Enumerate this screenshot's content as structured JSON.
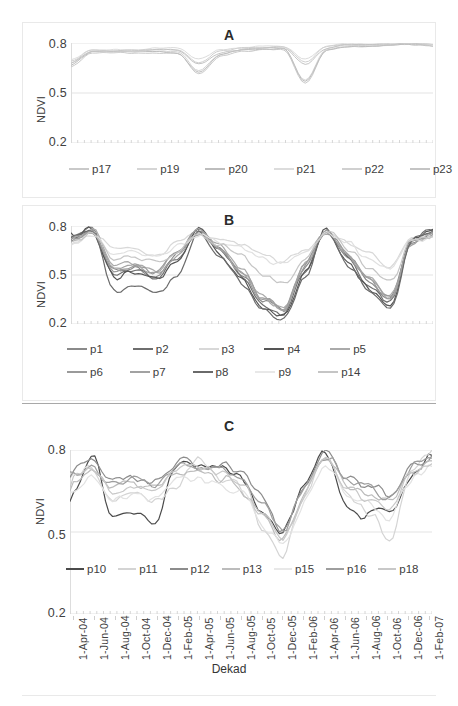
{
  "figure": {
    "axis_title_y": "NDVI",
    "axis_title_x": "Dekad",
    "y_ticks": [
      "0.2",
      "0.5",
      "0.8"
    ],
    "x_ticks": [
      "1-Apr-04",
      "1-Jun-04",
      "1-Aug-04",
      "1-Oct-04",
      "1-Dec-04",
      "1-Feb-05",
      "1-Apr-05",
      "1-Jun-05",
      "1-Aug-05",
      "1-Oct-05",
      "1-Dec-05",
      "1-Feb-06",
      "1-Apr-06",
      "1-Jun-06",
      "1-Aug-06",
      "1-Oct-06",
      "1-Dec-06",
      "1-Feb-07"
    ],
    "panels": {
      "a_title": "A",
      "b_title": "B",
      "c_title": "C"
    }
  },
  "chart_data": [
    {
      "type": "line",
      "title": "A",
      "xlabel": "",
      "ylabel": "NDVI",
      "ylim": [
        0.2,
        0.8
      ],
      "grid": true,
      "legend_position": "below",
      "x": [
        "1-Apr-04",
        "1-Jun-04",
        "1-Aug-04",
        "1-Oct-04",
        "1-Dec-04",
        "1-Feb-05",
        "1-Apr-05",
        "1-Jun-05",
        "1-Aug-05",
        "1-Oct-05",
        "1-Dec-05",
        "1-Feb-06",
        "1-Apr-06",
        "1-Jun-06",
        "1-Aug-06",
        "1-Oct-06",
        "1-Dec-06",
        "1-Feb-07"
      ],
      "series": [
        {
          "name": "p17",
          "color": "#c9c9c9",
          "values": [
            0.66,
            0.74,
            0.74,
            0.74,
            0.74,
            0.74,
            0.61,
            0.72,
            0.75,
            0.76,
            0.76,
            0.55,
            0.76,
            0.78,
            0.78,
            0.79,
            0.79,
            0.79
          ]
        },
        {
          "name": "p19",
          "color": "#d5d5d5",
          "values": [
            0.68,
            0.75,
            0.74,
            0.75,
            0.75,
            0.75,
            0.63,
            0.73,
            0.76,
            0.77,
            0.77,
            0.57,
            0.77,
            0.79,
            0.78,
            0.79,
            0.8,
            0.78
          ]
        },
        {
          "name": "p20",
          "color": "#bdbdbd",
          "values": [
            0.67,
            0.75,
            0.75,
            0.75,
            0.75,
            0.74,
            0.62,
            0.73,
            0.76,
            0.76,
            0.77,
            0.56,
            0.76,
            0.78,
            0.78,
            0.79,
            0.79,
            0.79
          ]
        },
        {
          "name": "p21",
          "color": "#dcdcdc",
          "values": [
            0.7,
            0.76,
            0.76,
            0.76,
            0.77,
            0.77,
            0.7,
            0.76,
            0.77,
            0.78,
            0.78,
            0.7,
            0.78,
            0.8,
            0.79,
            0.8,
            0.8,
            0.79
          ]
        },
        {
          "name": "p22",
          "color": "#d0d0d0",
          "values": [
            0.69,
            0.76,
            0.75,
            0.75,
            0.76,
            0.76,
            0.68,
            0.75,
            0.77,
            0.77,
            0.78,
            0.68,
            0.78,
            0.79,
            0.79,
            0.8,
            0.8,
            0.79
          ]
        },
        {
          "name": "p23",
          "color": "#c4c4c4",
          "values": [
            0.68,
            0.75,
            0.75,
            0.76,
            0.76,
            0.76,
            0.67,
            0.74,
            0.76,
            0.77,
            0.77,
            0.67,
            0.77,
            0.79,
            0.79,
            0.79,
            0.8,
            0.78
          ]
        }
      ]
    },
    {
      "type": "line",
      "title": "B",
      "xlabel": "",
      "ylabel": "NDVI",
      "ylim": [
        0.2,
        0.8
      ],
      "grid": true,
      "legend_position": "below",
      "x": [
        "1-Apr-04",
        "1-Jun-04",
        "1-Aug-04",
        "1-Oct-04",
        "1-Dec-04",
        "1-Feb-05",
        "1-Apr-05",
        "1-Jun-05",
        "1-Aug-05",
        "1-Oct-05",
        "1-Dec-05",
        "1-Feb-06",
        "1-Apr-06",
        "1-Jun-06",
        "1-Aug-06",
        "1-Oct-06",
        "1-Dec-06",
        "1-Feb-07"
      ],
      "series": [
        {
          "name": "p1",
          "color": "#8a8a8a",
          "values": [
            0.72,
            0.79,
            0.52,
            0.55,
            0.5,
            0.62,
            0.78,
            0.66,
            0.52,
            0.34,
            0.28,
            0.55,
            0.78,
            0.62,
            0.46,
            0.34,
            0.7,
            0.76
          ]
        },
        {
          "name": "p2",
          "color": "#6e6e6e",
          "values": [
            0.73,
            0.78,
            0.5,
            0.53,
            0.48,
            0.6,
            0.79,
            0.64,
            0.5,
            0.32,
            0.26,
            0.53,
            0.79,
            0.6,
            0.44,
            0.32,
            0.72,
            0.77
          ]
        },
        {
          "name": "p3",
          "color": "#d8d8d8",
          "values": [
            0.7,
            0.76,
            0.66,
            0.66,
            0.62,
            0.7,
            0.76,
            0.72,
            0.68,
            0.62,
            0.58,
            0.66,
            0.77,
            0.7,
            0.62,
            0.56,
            0.72,
            0.74
          ]
        },
        {
          "name": "p4",
          "color": "#555555",
          "values": [
            0.74,
            0.79,
            0.48,
            0.52,
            0.47,
            0.59,
            0.79,
            0.63,
            0.47,
            0.3,
            0.24,
            0.52,
            0.79,
            0.58,
            0.42,
            0.29,
            0.72,
            0.78
          ]
        },
        {
          "name": "p5",
          "color": "#aaaaaa",
          "values": [
            0.71,
            0.78,
            0.55,
            0.57,
            0.52,
            0.64,
            0.77,
            0.67,
            0.54,
            0.36,
            0.3,
            0.57,
            0.78,
            0.63,
            0.48,
            0.36,
            0.7,
            0.75
          ]
        },
        {
          "name": "p6",
          "color": "#9a9a9a",
          "values": [
            0.72,
            0.77,
            0.53,
            0.56,
            0.51,
            0.63,
            0.77,
            0.66,
            0.53,
            0.35,
            0.29,
            0.56,
            0.78,
            0.62,
            0.47,
            0.35,
            0.71,
            0.76
          ]
        },
        {
          "name": "p7",
          "color": "#a2a2a2",
          "values": [
            0.7,
            0.77,
            0.54,
            0.56,
            0.51,
            0.63,
            0.76,
            0.66,
            0.53,
            0.35,
            0.29,
            0.56,
            0.77,
            0.62,
            0.47,
            0.35,
            0.7,
            0.75
          ]
        },
        {
          "name": "p8",
          "color": "#6a6a6a",
          "values": [
            0.73,
            0.78,
            0.4,
            0.42,
            0.38,
            0.5,
            0.78,
            0.6,
            0.45,
            0.28,
            0.23,
            0.5,
            0.78,
            0.56,
            0.4,
            0.27,
            0.72,
            0.77
          ]
        },
        {
          "name": "p9",
          "color": "#e0e0e0",
          "values": [
            0.69,
            0.75,
            0.64,
            0.64,
            0.6,
            0.68,
            0.75,
            0.71,
            0.67,
            0.6,
            0.56,
            0.64,
            0.76,
            0.69,
            0.6,
            0.54,
            0.71,
            0.73
          ]
        },
        {
          "name": "p14",
          "color": "#c5c5c5",
          "values": [
            0.7,
            0.76,
            0.6,
            0.61,
            0.57,
            0.66,
            0.76,
            0.69,
            0.62,
            0.5,
            0.44,
            0.6,
            0.77,
            0.66,
            0.55,
            0.45,
            0.71,
            0.74
          ]
        }
      ]
    },
    {
      "type": "line",
      "title": "C",
      "xlabel": "Dekad",
      "ylabel": "NDVI",
      "ylim": [
        0.2,
        0.8
      ],
      "grid": true,
      "legend_position": "below",
      "x": [
        "1-Apr-04",
        "1-Jun-04",
        "1-Aug-04",
        "1-Oct-04",
        "1-Dec-04",
        "1-Feb-05",
        "1-Apr-05",
        "1-Jun-05",
        "1-Aug-05",
        "1-Oct-05",
        "1-Dec-05",
        "1-Feb-06",
        "1-Apr-06",
        "1-Jun-06",
        "1-Aug-06",
        "1-Oct-06",
        "1-Dec-06",
        "1-Feb-07"
      ],
      "series": [
        {
          "name": "p10",
          "color": "#4a4a4a",
          "values": [
            0.62,
            0.79,
            0.55,
            0.57,
            0.54,
            0.73,
            0.76,
            0.74,
            0.7,
            0.58,
            0.5,
            0.66,
            0.8,
            0.58,
            0.56,
            0.56,
            0.7,
            0.78
          ]
        },
        {
          "name": "p11",
          "color": "#d4d4d4",
          "values": [
            0.7,
            0.73,
            0.62,
            0.64,
            0.6,
            0.67,
            0.76,
            0.7,
            0.67,
            0.52,
            0.42,
            0.62,
            0.79,
            0.64,
            0.58,
            0.46,
            0.72,
            0.8
          ]
        },
        {
          "name": "p12",
          "color": "#8c8c8c",
          "values": [
            0.72,
            0.76,
            0.68,
            0.7,
            0.68,
            0.76,
            0.74,
            0.74,
            0.71,
            0.62,
            0.5,
            0.68,
            0.8,
            0.7,
            0.67,
            0.64,
            0.74,
            0.78
          ]
        },
        {
          "name": "p13",
          "color": "#bcbcbc",
          "values": [
            0.68,
            0.72,
            0.66,
            0.68,
            0.66,
            0.72,
            0.72,
            0.7,
            0.66,
            0.58,
            0.48,
            0.64,
            0.77,
            0.68,
            0.64,
            0.6,
            0.72,
            0.76
          ]
        },
        {
          "name": "p15",
          "color": "#e2e2e2",
          "values": [
            0.66,
            0.7,
            0.62,
            0.64,
            0.62,
            0.7,
            0.7,
            0.68,
            0.64,
            0.54,
            0.44,
            0.6,
            0.74,
            0.64,
            0.6,
            0.56,
            0.7,
            0.74
          ]
        },
        {
          "name": "p16",
          "color": "#9e9e9e",
          "values": [
            0.71,
            0.75,
            0.67,
            0.69,
            0.67,
            0.74,
            0.75,
            0.73,
            0.7,
            0.6,
            0.5,
            0.66,
            0.79,
            0.69,
            0.66,
            0.62,
            0.73,
            0.77
          ]
        },
        {
          "name": "p18",
          "color": "#c8c8c8",
          "values": [
            0.69,
            0.74,
            0.65,
            0.67,
            0.65,
            0.73,
            0.73,
            0.71,
            0.68,
            0.56,
            0.46,
            0.63,
            0.78,
            0.66,
            0.62,
            0.58,
            0.71,
            0.75
          ]
        }
      ]
    }
  ],
  "legends": {
    "a": [
      {
        "label": "p17",
        "color": "#c9c9c9"
      },
      {
        "label": "p19",
        "color": "#d5d5d5"
      },
      {
        "label": "p20",
        "color": "#bdbdbd"
      },
      {
        "label": "p21",
        "color": "#dcdcdc"
      },
      {
        "label": "p22",
        "color": "#d0d0d0"
      },
      {
        "label": "p23",
        "color": "#c4c4c4"
      }
    ],
    "b_row1": [
      {
        "label": "p1",
        "color": "#8a8a8a"
      },
      {
        "label": "p2",
        "color": "#6e6e6e"
      },
      {
        "label": "p3",
        "color": "#d8d8d8"
      },
      {
        "label": "p4",
        "color": "#555555"
      },
      {
        "label": "p5",
        "color": "#aaaaaa"
      }
    ],
    "b_row2": [
      {
        "label": "p6",
        "color": "#9a9a9a"
      },
      {
        "label": "p7",
        "color": "#a2a2a2"
      },
      {
        "label": "p8",
        "color": "#6a6a6a"
      },
      {
        "label": "p9",
        "color": "#e8e8e8"
      },
      {
        "label": "p14",
        "color": "#c5c5c5"
      }
    ],
    "c": [
      {
        "label": "p10",
        "color": "#4a4a4a"
      },
      {
        "label": "p11",
        "color": "#d4d4d4"
      },
      {
        "label": "p12",
        "color": "#8c8c8c"
      },
      {
        "label": "p13",
        "color": "#bcbcbc"
      },
      {
        "label": "p15",
        "color": "#e8e8e8"
      },
      {
        "label": "p16",
        "color": "#9e9e9e"
      },
      {
        "label": "p18",
        "color": "#c8c8c8"
      }
    ]
  }
}
